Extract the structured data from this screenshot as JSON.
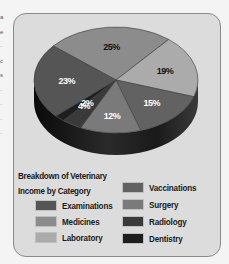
{
  "chart_data": {
    "type": "pie",
    "title": "Breakdown of Veterinary Income by Category",
    "style": "3D pie, grayscale",
    "categories": [
      "Medicines",
      "Laboratory",
      "Vaccinations",
      "Surgery",
      "Radiology",
      "Dentistry",
      "Examinations"
    ],
    "values": [
      25,
      19,
      15,
      12,
      4,
      2,
      23
    ],
    "value_labels": [
      "25%",
      "19%",
      "15%",
      "12%",
      "4%",
      "2%",
      "23%"
    ],
    "unit": "%",
    "legend_position": "bottom",
    "colors": {
      "Examinations": "#555555",
      "Medicines": "#8c8c8c",
      "Laboratory": "#ababab",
      "Vaccinations": "#626262",
      "Surgery": "#7a7a7a",
      "Radiology": "#3a3a3a",
      "Dentistry": "#1e1e1e"
    }
  },
  "legend": {
    "title_line1": "Breakdown of Veterinary",
    "title_line2": "Income by Category",
    "items": [
      {
        "label": "Examinations",
        "color": "#555555"
      },
      {
        "label": "Medicines",
        "color": "#8c8c8c"
      },
      {
        "label": "Laboratory",
        "color": "#ababab"
      },
      {
        "label": "Vaccinations",
        "color": "#626262"
      },
      {
        "label": "Surgery",
        "color": "#7a7a7a"
      },
      {
        "label": "Radiology",
        "color": "#3a3a3a"
      },
      {
        "label": "Dentistry",
        "color": "#1e1e1e"
      }
    ]
  },
  "labels": {
    "medicines": "25%",
    "laboratory": "19%",
    "vaccinations": "15%",
    "surgery": "12%",
    "radiology": "4%",
    "dentistry": "2%",
    "examinations": "23%"
  }
}
